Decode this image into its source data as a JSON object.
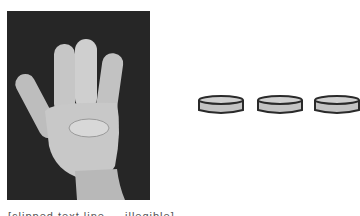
{
  "image": {
    "description": "Photo of a hand showing four fingers (thumb folded)",
    "icon": "hand-four-fingers-photo"
  },
  "tokens": {
    "count": 3,
    "icon": "counter-token-disc",
    "fill_color": "#c4c4c4",
    "stroke_color": "#2a2a2a"
  },
  "caption": {
    "text": "[clipped text line — illegible]"
  }
}
